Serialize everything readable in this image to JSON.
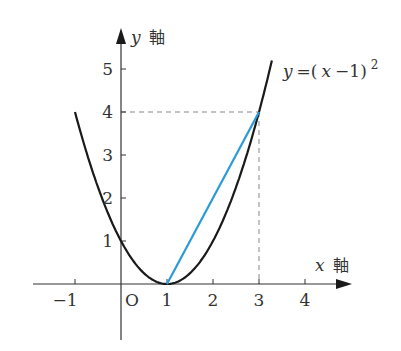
{
  "figure": {
    "type": "function-graph",
    "function_label": {
      "lhs": "y",
      "rhs_open": "=(",
      "var": "x",
      "rhs_close": "−1)",
      "exponent": "2"
    },
    "x_axis": {
      "name": "x",
      "suffix": "軸",
      "ticks": [
        "−1",
        "2",
        "3",
        "4"
      ],
      "one_label": "1"
    },
    "y_axis": {
      "name": "y",
      "suffix": "軸",
      "ticks": [
        "1",
        "2",
        "3",
        "4",
        "5"
      ]
    },
    "origin_label": "O",
    "colors": {
      "curve": "#1a1a1a",
      "secant": "#2a9bd8",
      "axis": "#333333",
      "guide": "#888888"
    }
  },
  "chart_data": {
    "type": "line",
    "xlabel": "x 軸",
    "ylabel": "y 軸",
    "xlim": [
      -1.9,
      4.9
    ],
    "ylim": [
      -1.3,
      5.8
    ],
    "grid": false,
    "series": [
      {
        "name": "y=(x−1)^2",
        "type": "curve",
        "x_range": [
          -1,
          3.3
        ],
        "points": [
          [
            -1,
            4
          ],
          [
            0,
            1
          ],
          [
            1,
            0
          ],
          [
            2,
            1
          ],
          [
            3,
            4
          ],
          [
            3.3,
            5.29
          ]
        ]
      },
      {
        "name": "secant",
        "type": "segment",
        "color": "#2a9bd8",
        "points": [
          [
            1,
            0
          ],
          [
            3,
            4
          ]
        ]
      }
    ],
    "annotations": [
      {
        "type": "dashed-line",
        "from": [
          0,
          4
        ],
        "to": [
          3,
          4
        ]
      },
      {
        "type": "dashed-line",
        "from": [
          3,
          4
        ],
        "to": [
          3,
          0
        ]
      }
    ],
    "x_ticks": [
      -1,
      1,
      2,
      3,
      4
    ],
    "y_ticks": [
      1,
      2,
      3,
      4,
      5
    ]
  }
}
